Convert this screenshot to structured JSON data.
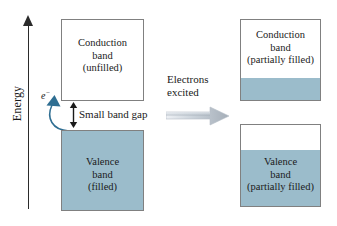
{
  "figure": {
    "axis": {
      "label": "Energy",
      "arrow_icon": "up-arrow-icon"
    },
    "colors": {
      "band_fill": "#9bbccb",
      "box_border": "#808080",
      "electron_arrow": "#2f6e92",
      "axis": "#2b2b2b",
      "block_arrow_light": "#e9edf2",
      "block_arrow_dark": "#9aa4ae"
    },
    "left_state": {
      "name": "ground-state",
      "conduction_band": {
        "lines": [
          "Conduction",
          "band",
          "(unfilled)"
        ],
        "fill_percent": 0
      },
      "valence_band": {
        "lines": [
          "Valence",
          "band",
          "(filled)"
        ],
        "fill_percent": 100
      },
      "band_gap_label": "Small band gap",
      "electron_label": "e",
      "electron_charge": "−"
    },
    "transition": {
      "lines": [
        "Electrons",
        "excited"
      ],
      "arrow_icon": "right-block-arrow-icon"
    },
    "right_state": {
      "name": "excited-state",
      "conduction_band": {
        "lines": [
          "Conduction",
          "band",
          "(partially filled)"
        ],
        "fill_percent": 28
      },
      "valence_band": {
        "lines": [
          "Valence",
          "band",
          "(partially filled)"
        ],
        "fill_percent": 69
      }
    }
  },
  "chart_data": {
    "type": "diagram",
    "panels": [
      {
        "panel": "before-excitation",
        "bands": [
          {
            "band": "Conduction band",
            "state": "unfilled",
            "fill_percent": 0
          },
          {
            "band": "Valence band",
            "state": "filled",
            "fill_percent": 100
          }
        ],
        "annotations": [
          "Small band gap",
          "e−"
        ]
      },
      {
        "panel": "after-excitation",
        "bands": [
          {
            "band": "Conduction band",
            "state": "partially filled",
            "fill_percent": 28
          },
          {
            "band": "Valence band",
            "state": "partially filled",
            "fill_percent": 69
          }
        ],
        "annotations": []
      }
    ],
    "transition_label": "Electrons excited",
    "ylabel": "Energy",
    "grid": false,
    "legend": "none"
  }
}
